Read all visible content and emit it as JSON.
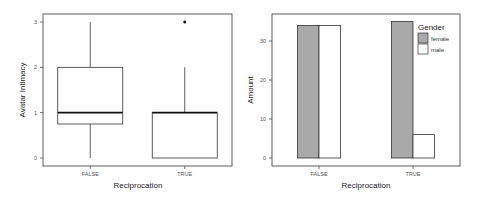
{
  "chart_data": [
    {
      "type": "box",
      "title": "",
      "xlabel": "Reciprocation",
      "ylabel": "Avatar Intimacy",
      "categories": [
        "FALSE",
        "TRUE"
      ],
      "yticks": [
        "0",
        "1",
        "2",
        "3"
      ],
      "ylim": [
        0,
        3
      ],
      "grid": false,
      "boxes": [
        {
          "category": "FALSE",
          "whisker_low": 0,
          "q1": 0.75,
          "median": 1,
          "q3": 2,
          "whisker_high": 3,
          "outliers": []
        },
        {
          "category": "TRUE",
          "whisker_low": 0,
          "q1": 0,
          "median": 1,
          "q3": 1,
          "whisker_high": 2,
          "outliers": [
            3
          ]
        }
      ]
    },
    {
      "type": "bar",
      "title": "",
      "xlabel": "Reciprocation",
      "ylabel": "Amount",
      "categories": [
        "FALSE",
        "TRUE"
      ],
      "yticks": [
        "0",
        "10",
        "20",
        "30"
      ],
      "ylim": [
        0,
        36
      ],
      "grid": false,
      "legend": {
        "title": "Gender",
        "position": "top-right-inside"
      },
      "series": [
        {
          "name": "female",
          "color": "#a9a9a9",
          "values": [
            34,
            35
          ]
        },
        {
          "name": "male",
          "color": "#ffffff",
          "values": [
            34,
            6
          ]
        }
      ]
    }
  ]
}
